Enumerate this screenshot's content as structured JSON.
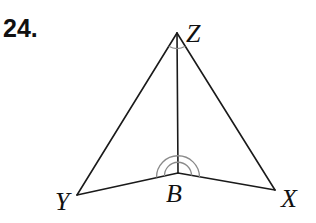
{
  "problem": {
    "number": "24."
  },
  "figure": {
    "vertices": {
      "Z": {
        "label": "Z",
        "x": 177,
        "y": 33
      },
      "B": {
        "label": "B",
        "x": 178,
        "y": 173
      },
      "Y": {
        "label": "Y",
        "x": 77,
        "y": 195
      },
      "X": {
        "label": "X",
        "x": 275,
        "y": 190
      }
    },
    "segments": [
      "ZY",
      "ZX",
      "ZB",
      "YB",
      "BX"
    ],
    "angle_marks": [
      {
        "vertex": "Z",
        "angle": "YZX",
        "arcs": 1
      },
      {
        "vertex": "B",
        "angle": "ZBY / ZBX",
        "arcs": 2
      }
    ],
    "colors": {
      "line": "#1a1a1a",
      "arc": "#8a8a8a",
      "text": "#111111"
    }
  }
}
